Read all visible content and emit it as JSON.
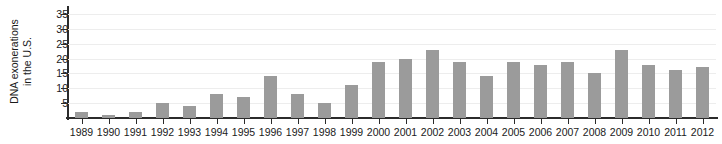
{
  "chart_data": {
    "type": "bar",
    "title": "",
    "subtitle": "",
    "xlabel": "",
    "ylabel": "DNA exonerations in the U.S.",
    "ylabel_line1": "DNA exonerations",
    "ylabel_line2": "in the U.S.",
    "categories": [
      "1989",
      "1990",
      "1991",
      "1992",
      "1993",
      "1994",
      "1995",
      "1996",
      "1997",
      "1998",
      "1999",
      "2000",
      "2001",
      "2002",
      "2003",
      "2004",
      "2005",
      "2006",
      "2007",
      "2008",
      "2009",
      "2010",
      "2011",
      "2012"
    ],
    "values": [
      2,
      1,
      2,
      5,
      4,
      8,
      7,
      14,
      8,
      5,
      11,
      19,
      20,
      23,
      19,
      14,
      19,
      18,
      19,
      15,
      23,
      18,
      16,
      17
    ],
    "ytick_labels": [
      "5",
      "10",
      "15",
      "20",
      "25",
      "30",
      "35"
    ],
    "ytick_values": [
      5,
      10,
      15,
      20,
      25,
      30,
      35
    ],
    "ylim": [
      0,
      37
    ],
    "grid": true,
    "legend": "none",
    "bar_color": "#9b9b9b",
    "axis_color": "#2b2b2b",
    "grid_color": "#ededed",
    "background_color": "#ffffff"
  }
}
